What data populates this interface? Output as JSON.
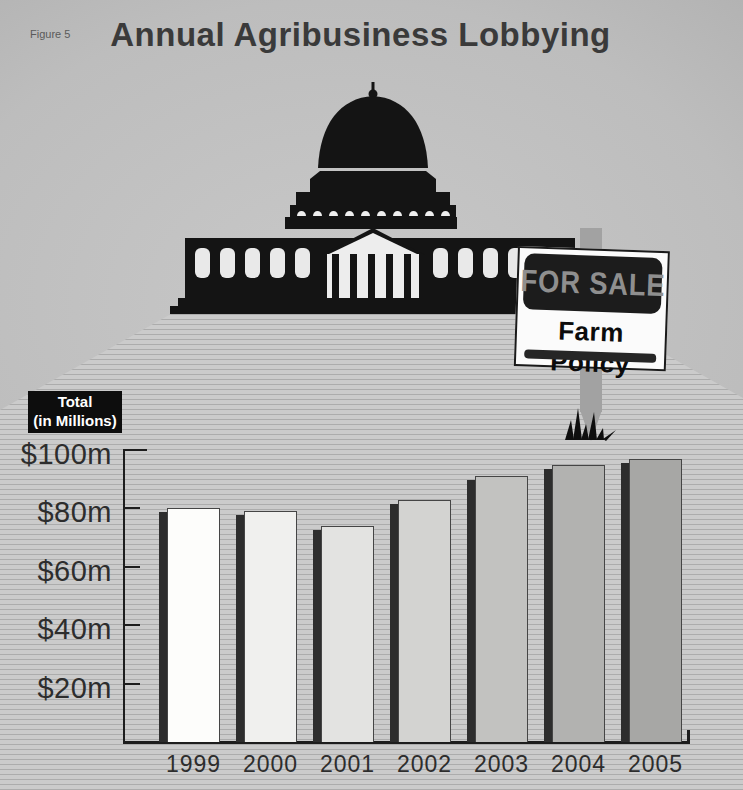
{
  "figure_label": "Figure 5",
  "title": "Annual Agribusiness Lobbying",
  "sign": {
    "banner": "FOR SALE",
    "caption": "Farm Policy"
  },
  "axis_box": {
    "line1": "Total",
    "line2": "(in Millions)"
  },
  "chart_data": {
    "type": "bar",
    "title": "Annual Agribusiness Lobbying",
    "ylabel": "Total (in Millions)",
    "unit": "USD millions",
    "categories": [
      "1999",
      "2000",
      "2001",
      "2002",
      "2003",
      "2004",
      "2005"
    ],
    "values": [
      80,
      79,
      74,
      83,
      91,
      95,
      97
    ],
    "ylim": [
      0,
      100
    ],
    "yticks": [
      {
        "value": 100,
        "label": "$100m"
      },
      {
        "value": 80,
        "label": "$80m"
      },
      {
        "value": 60,
        "label": "$60m"
      },
      {
        "value": 40,
        "label": "$40m"
      },
      {
        "value": 20,
        "label": "$20m"
      }
    ],
    "bar_colors": [
      "#fdfdfb",
      "#f0f0ee",
      "#e3e3e1",
      "#d3d3d1",
      "#c2c2c0",
      "#b2b2b0",
      "#a7a7a5"
    ],
    "bar_shadow_color": "#2d2d2d",
    "axis_color": "#1d1d1d",
    "label_color": "#2d2d2d",
    "grid": false,
    "legend": false
  },
  "palette": {
    "sky_dark": "#8d8d8d",
    "sky_light": "#c8c8c8",
    "plaza_base": "#cbcbcb",
    "plaza_stripe": "#acacac",
    "capitol_silhouette": "#141414",
    "sign_background": "#fbfbfb",
    "sign_banner_background": "#1c1c1c",
    "sign_banner_text": "#8f8f8f",
    "sign_post": "#a2a2a2",
    "total_box_background": "#0d0d0d",
    "total_box_text": "#ffffff"
  }
}
